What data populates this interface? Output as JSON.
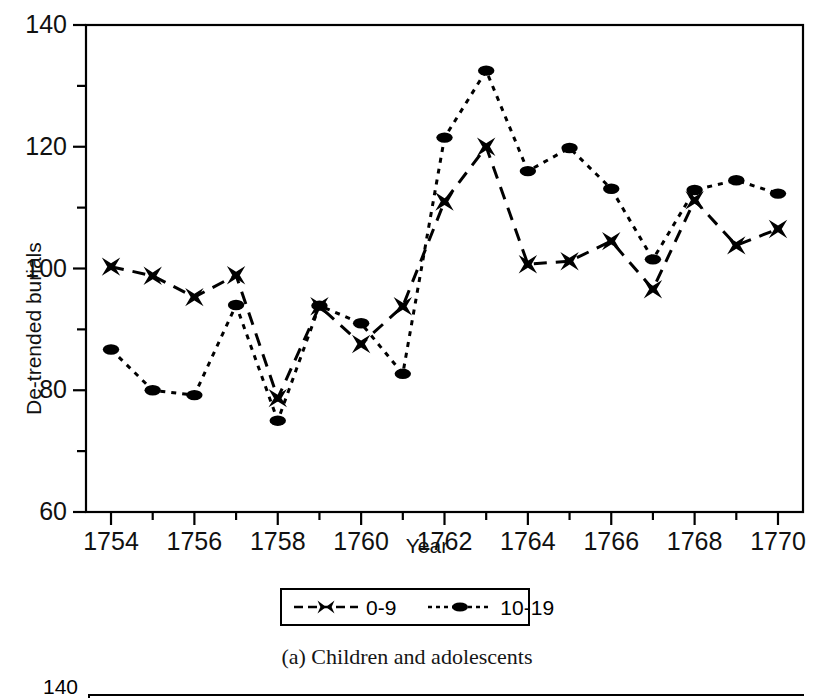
{
  "figure": {
    "caption": "(a) Children and adolescents"
  },
  "axes": {
    "y_title": "De-trended burials",
    "x_title": "Year",
    "y_ticks": [
      "140",
      "120",
      "100",
      "80",
      "60"
    ],
    "y_tick_values": [
      140,
      120,
      100,
      80,
      60
    ],
    "y_minor_tick_values": [
      130,
      110,
      90,
      70
    ],
    "x_ticks": [
      "1754",
      "1756",
      "1758",
      "1760",
      "1762",
      "1764",
      "1766",
      "1768",
      "1770"
    ],
    "x_tick_values": [
      1754,
      1756,
      1758,
      1760,
      1762,
      1764,
      1766,
      1768,
      1770
    ],
    "x_minor_tick_values": [
      1755,
      1757,
      1759,
      1761,
      1763,
      1765,
      1767,
      1769
    ]
  },
  "legend": {
    "position": "below-axes-center",
    "entries": [
      {
        "label": "0-9",
        "marker": "x-marker-icon",
        "line_style": "dashed"
      },
      {
        "label": "10-19",
        "marker": "filled-circle-marker-icon",
        "line_style": "dotted"
      }
    ]
  },
  "next_figure_stub": {
    "y_tick_label": "140"
  },
  "colors": {
    "foreground": "#000000",
    "background": "#ffffff"
  },
  "chart_data": {
    "type": "line",
    "title": "",
    "subtitle": "",
    "caption": "(a) Children and adolescents",
    "xlabel": "Year",
    "ylabel": "De-trended burials",
    "xlim": [
      1753.4,
      1770.6
    ],
    "ylim": [
      60,
      140
    ],
    "grid": false,
    "legend_position": "below",
    "x": [
      1754,
      1755,
      1756,
      1757,
      1758,
      1759,
      1760,
      1761,
      1762,
      1763,
      1764,
      1765,
      1766,
      1767,
      1768,
      1769,
      1770
    ],
    "series": [
      {
        "name": "0-9",
        "marker": "x",
        "line_style": "dashed",
        "values": [
          100.3,
          98.8,
          95.3,
          98.9,
          78.7,
          93.8,
          87.6,
          93.8,
          111.0,
          120.0,
          100.7,
          101.2,
          104.5,
          96.6,
          111.2,
          103.8,
          106.5
        ]
      },
      {
        "name": "10-19",
        "marker": "circle",
        "line_style": "dotted",
        "values": [
          86.7,
          80.0,
          79.2,
          94.0,
          75.0,
          93.9,
          91.0,
          82.7,
          121.5,
          132.5,
          116.0,
          119.8,
          113.1,
          101.5,
          112.9,
          114.5,
          112.3
        ]
      }
    ]
  }
}
